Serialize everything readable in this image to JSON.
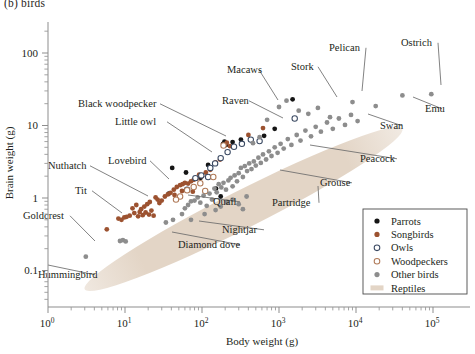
{
  "panel": {
    "label": "(b)  birds"
  },
  "chart_data": {
    "type": "scatter",
    "title": "(b)  birds",
    "xlabel": "Body weight (g)",
    "ylabel": "Brain weight (g)",
    "xscale": "log",
    "yscale": "log",
    "xlim": [
      1,
      100000
    ],
    "ylim": [
      0.04,
      300
    ],
    "grid": false,
    "legend_position": "bottom-right",
    "xticks": [
      {
        "value": 1,
        "label": "10",
        "exp": "0"
      },
      {
        "value": 10,
        "label": "10",
        "exp": "1"
      },
      {
        "value": 100,
        "label": "10",
        "exp": "2"
      },
      {
        "value": 1000,
        "label": "10",
        "exp": "3"
      },
      {
        "value": 10000,
        "label": "10",
        "exp": "4"
      },
      {
        "value": 100000,
        "label": "10",
        "exp": "5"
      }
    ],
    "yticks": [
      {
        "value": 100,
        "label": "100"
      },
      {
        "value": 10,
        "label": "10"
      },
      {
        "value": 1,
        "label": "1"
      },
      {
        "value": 0.1,
        "label": "0.1"
      }
    ],
    "legend": [
      {
        "name": "Parrots",
        "marker": "filled-circle",
        "color": "#151515"
      },
      {
        "name": "Songbirds",
        "marker": "filled-circle",
        "color": "#9c5230"
      },
      {
        "name": "Owls",
        "marker": "open-circle",
        "color": "#3b4a63"
      },
      {
        "name": "Woodpeckers",
        "marker": "open-circle",
        "color": "#b07a58"
      },
      {
        "name": "Other birds",
        "marker": "filled-circle",
        "color": "#8d8d8d"
      },
      {
        "name": "Reptiles",
        "marker": "band",
        "color": "#e3d5c6"
      }
    ],
    "reptile_band": {
      "label": "Reptiles",
      "color": "#e3d5c6",
      "description": "diagonal elongated ellipse spanning body weight ~3 g to ~3x10^4 g",
      "x_start": 3.0,
      "y_start": 0.055,
      "x_end": 40000,
      "y_end": 9.0,
      "thickness_decades": 0.52
    },
    "series": [
      {
        "name": "Parrots",
        "color": "#151515",
        "marker": "filled-circle",
        "points": [
          {
            "x": 41,
            "y": 2.6
          },
          {
            "x": 37,
            "y": 1.15
          },
          {
            "x": 96,
            "y": 1.9
          },
          {
            "x": 120,
            "y": 2.85
          },
          {
            "x": 152,
            "y": 1.35
          },
          {
            "x": 188,
            "y": 5.6
          },
          {
            "x": 196,
            "y": 6.0
          },
          {
            "x": 205,
            "y": 5.4
          },
          {
            "x": 250,
            "y": 5.9
          },
          {
            "x": 320,
            "y": 6.4
          },
          {
            "x": 640,
            "y": 7.2
          },
          {
            "x": 880,
            "y": 9.0
          },
          {
            "x": 1500,
            "y": 23.0
          },
          {
            "x": 175,
            "y": 1.05
          },
          {
            "x": 62,
            "y": 2.25
          }
        ]
      },
      {
        "name": "Songbirds",
        "color": "#9c5230",
        "marker": "filled-circle",
        "points": [
          {
            "x": 5.8,
            "y": 0.37
          },
          {
            "x": 8.2,
            "y": 0.52
          },
          {
            "x": 9.0,
            "y": 0.5
          },
          {
            "x": 9.8,
            "y": 0.54
          },
          {
            "x": 10.5,
            "y": 0.55
          },
          {
            "x": 11.5,
            "y": 0.57
          },
          {
            "x": 12.5,
            "y": 0.72
          },
          {
            "x": 13.2,
            "y": 0.62
          },
          {
            "x": 14.0,
            "y": 0.8
          },
          {
            "x": 14.8,
            "y": 0.56
          },
          {
            "x": 15.5,
            "y": 0.64
          },
          {
            "x": 16.2,
            "y": 0.7
          },
          {
            "x": 17.0,
            "y": 0.58
          },
          {
            "x": 17.8,
            "y": 0.76
          },
          {
            "x": 18.5,
            "y": 0.63
          },
          {
            "x": 19.4,
            "y": 0.82
          },
          {
            "x": 20.5,
            "y": 0.59
          },
          {
            "x": 21.0,
            "y": 0.88
          },
          {
            "x": 22.0,
            "y": 0.67
          },
          {
            "x": 23.5,
            "y": 0.57
          },
          {
            "x": 25.0,
            "y": 1.02
          },
          {
            "x": 26.5,
            "y": 0.95
          },
          {
            "x": 28.0,
            "y": 0.85
          },
          {
            "x": 30.0,
            "y": 0.92
          },
          {
            "x": 33.0,
            "y": 1.05
          },
          {
            "x": 36.0,
            "y": 1.12
          },
          {
            "x": 39.0,
            "y": 1.18
          },
          {
            "x": 43.0,
            "y": 1.3
          },
          {
            "x": 47.0,
            "y": 1.42
          },
          {
            "x": 52.0,
            "y": 1.5
          },
          {
            "x": 56.0,
            "y": 1.55
          },
          {
            "x": 60.0,
            "y": 1.62
          },
          {
            "x": 66.0,
            "y": 1.58
          },
          {
            "x": 72.0,
            "y": 1.7
          },
          {
            "x": 78.0,
            "y": 1.78
          },
          {
            "x": 85.0,
            "y": 1.85
          },
          {
            "x": 92.0,
            "y": 2.1
          },
          {
            "x": 100,
            "y": 2.0
          },
          {
            "x": 112,
            "y": 2.25
          },
          {
            "x": 128,
            "y": 2.45
          },
          {
            "x": 150,
            "y": 3.1
          },
          {
            "x": 172,
            "y": 3.4
          },
          {
            "x": 210,
            "y": 5.8
          },
          {
            "x": 230,
            "y": 5.2
          },
          {
            "x": 400,
            "y": 7.4
          },
          {
            "x": 620,
            "y": 9.2
          },
          {
            "x": 76,
            "y": 1.22
          },
          {
            "x": 55,
            "y": 1.25
          },
          {
            "x": 44,
            "y": 1.1
          }
        ]
      },
      {
        "name": "Owls",
        "color": "#3b4a63",
        "marker": "open-circle",
        "points": [
          {
            "x": 82,
            "y": 1.88
          },
          {
            "x": 98,
            "y": 2.05
          },
          {
            "x": 128,
            "y": 2.6
          },
          {
            "x": 148,
            "y": 3.0
          },
          {
            "x": 175,
            "y": 3.55
          },
          {
            "x": 215,
            "y": 4.3
          },
          {
            "x": 260,
            "y": 5.1
          },
          {
            "x": 330,
            "y": 5.6
          },
          {
            "x": 430,
            "y": 6.4
          },
          {
            "x": 560,
            "y": 6.1
          },
          {
            "x": 1600,
            "y": 12.5
          },
          {
            "x": 120,
            "y": 1.95
          },
          {
            "x": 64,
            "y": 1.3
          }
        ]
      },
      {
        "name": "Woodpeckers",
        "color": "#b07a58",
        "marker": "open-circle",
        "points": [
          {
            "x": 64,
            "y": 1.28
          },
          {
            "x": 78,
            "y": 1.42
          },
          {
            "x": 95,
            "y": 1.6
          },
          {
            "x": 110,
            "y": 1.25
          },
          {
            "x": 140,
            "y": 1.95
          },
          {
            "x": 190,
            "y": 5.3
          },
          {
            "x": 52,
            "y": 1.05
          },
          {
            "x": 46,
            "y": 0.95
          }
        ]
      },
      {
        "name": "Other birds",
        "color": "#8d8d8d",
        "marker": "filled-circle",
        "points": [
          {
            "x": 3.1,
            "y": 0.155
          },
          {
            "x": 8.6,
            "y": 0.255
          },
          {
            "x": 9.4,
            "y": 0.262
          },
          {
            "x": 10.2,
            "y": 0.252
          },
          {
            "x": 34,
            "y": 0.46
          },
          {
            "x": 42,
            "y": 0.5
          },
          {
            "x": 55,
            "y": 0.6
          },
          {
            "x": 60,
            "y": 0.72
          },
          {
            "x": 66,
            "y": 0.8
          },
          {
            "x": 72,
            "y": 0.9
          },
          {
            "x": 80,
            "y": 0.92
          },
          {
            "x": 88,
            "y": 1.02
          },
          {
            "x": 95,
            "y": 0.86
          },
          {
            "x": 105,
            "y": 1.08
          },
          {
            "x": 115,
            "y": 0.78
          },
          {
            "x": 125,
            "y": 1.15
          },
          {
            "x": 135,
            "y": 0.95
          },
          {
            "x": 145,
            "y": 1.35
          },
          {
            "x": 155,
            "y": 1.2
          },
          {
            "x": 165,
            "y": 1.55
          },
          {
            "x": 178,
            "y": 1.4
          },
          {
            "x": 190,
            "y": 1.62
          },
          {
            "x": 205,
            "y": 1.3
          },
          {
            "x": 220,
            "y": 1.75
          },
          {
            "x": 235,
            "y": 1.9
          },
          {
            "x": 250,
            "y": 1.45
          },
          {
            "x": 265,
            "y": 2.05
          },
          {
            "x": 285,
            "y": 1.7
          },
          {
            "x": 300,
            "y": 2.2
          },
          {
            "x": 320,
            "y": 2.6
          },
          {
            "x": 340,
            "y": 1.95
          },
          {
            "x": 360,
            "y": 2.75
          },
          {
            "x": 385,
            "y": 2.35
          },
          {
            "x": 410,
            "y": 3.0
          },
          {
            "x": 440,
            "y": 2.5
          },
          {
            "x": 470,
            "y": 3.2
          },
          {
            "x": 500,
            "y": 2.8
          },
          {
            "x": 540,
            "y": 3.6
          },
          {
            "x": 580,
            "y": 3.05
          },
          {
            "x": 620,
            "y": 4.0
          },
          {
            "x": 680,
            "y": 3.4
          },
          {
            "x": 740,
            "y": 4.4
          },
          {
            "x": 800,
            "y": 3.8
          },
          {
            "x": 880,
            "y": 5.0
          },
          {
            "x": 960,
            "y": 4.2
          },
          {
            "x": 1050,
            "y": 5.6
          },
          {
            "x": 1150,
            "y": 4.8
          },
          {
            "x": 1300,
            "y": 6.5
          },
          {
            "x": 1450,
            "y": 5.4
          },
          {
            "x": 1700,
            "y": 7.4
          },
          {
            "x": 1900,
            "y": 6.2
          },
          {
            "x": 2200,
            "y": 8.5
          },
          {
            "x": 2600,
            "y": 7.1
          },
          {
            "x": 3000,
            "y": 9.6
          },
          {
            "x": 3500,
            "y": 8.2
          },
          {
            "x": 4200,
            "y": 11.0
          },
          {
            "x": 5000,
            "y": 9.0
          },
          {
            "x": 6000,
            "y": 12.5
          },
          {
            "x": 7200,
            "y": 10.2
          },
          {
            "x": 8600,
            "y": 14.0
          },
          {
            "x": 10500,
            "y": 11.5
          },
          {
            "x": 460,
            "y": 5.7
          },
          {
            "x": 560,
            "y": 6.9
          },
          {
            "x": 700,
            "y": 12.0
          },
          {
            "x": 1000,
            "y": 18.0
          },
          {
            "x": 1250,
            "y": 22.0
          },
          {
            "x": 1800,
            "y": 16.0
          },
          {
            "x": 2400,
            "y": 14.5
          },
          {
            "x": 3200,
            "y": 17.5
          },
          {
            "x": 4600,
            "y": 13.0
          },
          {
            "x": 9000,
            "y": 21.0
          },
          {
            "x": 18000,
            "y": 18.5
          },
          {
            "x": 40000,
            "y": 26.0
          },
          {
            "x": 95000,
            "y": 27.0
          },
          {
            "x": 300,
            "y": 0.82
          },
          {
            "x": 340,
            "y": 0.7
          },
          {
            "x": 380,
            "y": 1.05
          },
          {
            "x": 250,
            "y": 0.95
          },
          {
            "x": 210,
            "y": 0.88
          },
          {
            "x": 175,
            "y": 0.76
          },
          {
            "x": 150,
            "y": 0.68
          },
          {
            "x": 108,
            "y": 0.6
          },
          {
            "x": 72,
            "y": 0.5
          }
        ]
      }
    ],
    "annotations": [
      {
        "label": "Hummingbird",
        "tx": 38,
        "ty": 278,
        "anchor": "start",
        "px": 48,
        "py": 265
      },
      {
        "label": "Goldcrest",
        "tx": 23,
        "ty": 219,
        "anchor": "start",
        "px": 95,
        "py": 241
      },
      {
        "label": "Tit",
        "tx": 75,
        "ty": 194,
        "anchor": "start",
        "px": 122,
        "py": 213
      },
      {
        "label": "Nuthatch",
        "tx": 48,
        "ty": 169,
        "anchor": "start",
        "px": 148,
        "py": 196
      },
      {
        "label": "Lovebird",
        "tx": 108,
        "ty": 164,
        "anchor": "start",
        "px": 169,
        "py": 179
      },
      {
        "label": "Little owl",
        "tx": 115,
        "ty": 125,
        "anchor": "start",
        "px": 212,
        "py": 152
      },
      {
        "label": "Black woodpecker",
        "tx": 78,
        "ty": 107,
        "anchor": "start",
        "px": 226,
        "py": 136
      },
      {
        "label": "Raven",
        "tx": 222,
        "ty": 104,
        "anchor": "start",
        "px": 283,
        "py": 118
      },
      {
        "label": "Macaws",
        "tx": 227,
        "ty": 73,
        "anchor": "start",
        "px": 278,
        "py": 100
      },
      {
        "label": "Stork",
        "tx": 291,
        "ty": 70,
        "anchor": "start",
        "px": 337,
        "py": 97
      },
      {
        "label": "Pelican",
        "tx": 329,
        "ty": 51,
        "anchor": "start",
        "px": 362,
        "py": 91
      },
      {
        "label": "Ostrich",
        "tx": 401,
        "ty": 46,
        "anchor": "start",
        "px": 441,
        "py": 85
      },
      {
        "label": "Emu",
        "tx": 425,
        "ty": 112,
        "anchor": "start",
        "px": 413,
        "py": 97
      },
      {
        "label": "Swan",
        "tx": 380,
        "ty": 129,
        "anchor": "start",
        "px": 368,
        "py": 114
      },
      {
        "label": "Peacock",
        "tx": 360,
        "ty": 162,
        "anchor": "start",
        "px": 310,
        "py": 145
      },
      {
        "label": "Grouse",
        "tx": 320,
        "ty": 186,
        "anchor": "start",
        "px": 280,
        "py": 170
      },
      {
        "label": "Partridge",
        "tx": 272,
        "ty": 206,
        "anchor": "start",
        "px": 318,
        "py": 186
      },
      {
        "label": "Quail",
        "tx": 213,
        "ty": 205,
        "anchor": "start",
        "px": 188,
        "py": 195
      },
      {
        "label": "Nightjar",
        "tx": 222,
        "ty": 233,
        "anchor": "start",
        "px": 199,
        "py": 221
      },
      {
        "label": "Diamond dove",
        "tx": 178,
        "ty": 248,
        "anchor": "start",
        "px": 172,
        "py": 232
      }
    ]
  }
}
